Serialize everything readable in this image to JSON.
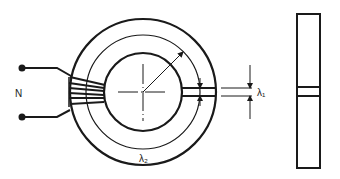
{
  "diagram": {
    "type": "toroidal-core-with-air-gap",
    "labels": {
      "turns": "N",
      "gap_length": "λ₁",
      "core_path_length": "λ₂"
    },
    "colors": {
      "stroke": "#1a1a1a",
      "background": "#ffffff"
    },
    "views": [
      "front-view",
      "side-view"
    ]
  }
}
